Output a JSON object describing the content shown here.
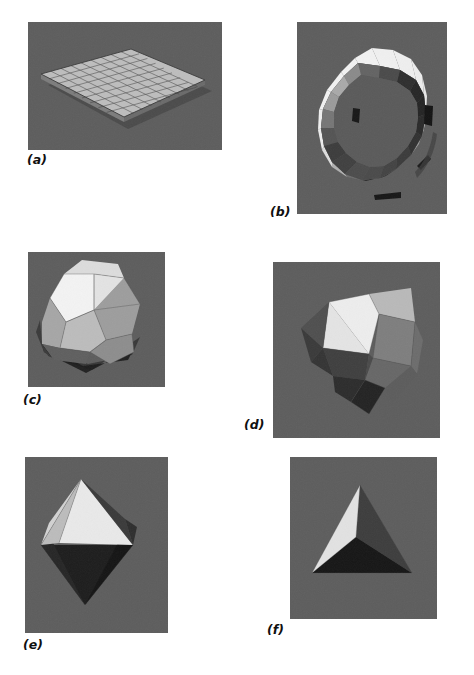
{
  "figure": {
    "kind": "figure-plate",
    "background_color": "#ffffff",
    "panel_background_color": "#5d5d5d",
    "caption_color": "#101010",
    "panels": [
      {
        "id": "a",
        "caption": "(a)",
        "subject": "flat-shaded-tessellated-plane",
        "description": "Polygon mesh plane subdivided into a square grid, viewed in perspective",
        "grid_rows": 9,
        "grid_cols": 9,
        "rect": {
          "x": 28,
          "y": 22,
          "w": 194,
          "h": 128
        },
        "caption_pos": {
          "x": 27,
          "y": 154
        },
        "face_color": "#b9b9b9",
        "edge_color": "#3a3a3a",
        "side_color": "#8e8e8e",
        "shadow_color": "#2a2a2a"
      },
      {
        "id": "b",
        "caption": "(b)",
        "subject": "flat-shaded-torus",
        "description": "Faceted torus built from quadrilateral patches with per-facet constant shading",
        "segments_major": 16,
        "segments_minor": 8,
        "rect": {
          "x": 297,
          "y": 22,
          "w": 150,
          "h": 192
        },
        "caption_pos": {
          "x": 270,
          "y": 206
        },
        "facet_shades": [
          "#f2f2f2",
          "#eaeaea",
          "#dcdcdc",
          "#c9c9c9",
          "#ababab",
          "#8f8f8f",
          "#6f6f6f",
          "#4e4e4e",
          "#343434",
          "#1e1e1e"
        ]
      },
      {
        "id": "c",
        "caption": "(c)",
        "subject": "flat-shaded-dodecahedron",
        "description": "Regular dodecahedron, twelve pentagonal faces each with constant intensity",
        "faces": 12,
        "rect": {
          "x": 28,
          "y": 252,
          "w": 137,
          "h": 135
        },
        "caption_pos": {
          "x": 23,
          "y": 394
        },
        "facet_shades": [
          "#f4f4f4",
          "#d8d8d8",
          "#bdbdbd",
          "#9d9d9d",
          "#7c7c7c",
          "#3a3a3a",
          "#141414"
        ]
      },
      {
        "id": "d",
        "caption": "(d)",
        "subject": "flat-shaded-icosahedron",
        "description": "Icosahedron rendered with twenty flat-shaded triangular faces",
        "faces": 20,
        "rect": {
          "x": 273,
          "y": 262,
          "w": 167,
          "h": 176
        },
        "caption_pos": {
          "x": 244,
          "y": 419
        },
        "facet_shades": [
          "#f6f6f6",
          "#e2e2e2",
          "#c4c4c4",
          "#a2a2a2",
          "#6e6e6e",
          "#454545",
          "#181818"
        ]
      },
      {
        "id": "e",
        "caption": "(e)",
        "subject": "flat-shaded-octahedron",
        "description": "Octahedron with bright upper faces and dark lower faces",
        "faces": 8,
        "rect": {
          "x": 25,
          "y": 457,
          "w": 143,
          "h": 176
        },
        "caption_pos": {
          "x": 23,
          "y": 639
        },
        "facet_shades": [
          "#ededed",
          "#d3d3d3",
          "#a8a8a8",
          "#3c3c3c",
          "#1d1d1d",
          "#0e0e0e"
        ]
      },
      {
        "id": "f",
        "caption": "(f)",
        "subject": "flat-shaded-tetrahedron",
        "description": "Tetrahedron with one highlighted face and two shadowed faces",
        "faces": 4,
        "rect": {
          "x": 290,
          "y": 457,
          "w": 147,
          "h": 162
        },
        "caption_pos": {
          "x": 267,
          "y": 624
        },
        "facet_shades": [
          "#e8e8e8",
          "#3f3f3f",
          "#1a1a1a"
        ]
      }
    ]
  }
}
